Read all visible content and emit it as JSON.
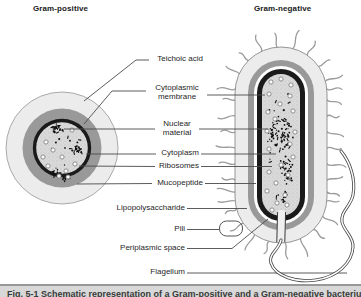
{
  "figure": {
    "titles": {
      "left": "Gram-positive",
      "right": "Gram-negative"
    },
    "labels": {
      "teichoic_acid": "Teichoic acid",
      "cytoplasmic_membrane": "Cytoplasmic membrane",
      "nuclear_material": "Nuclear material",
      "cytoplasm": "Cytoplasm",
      "ribosomes": "Ribosomes",
      "mucopeptide": "Mucopeptide",
      "lipopolysaccharide": "Lipopolysaccharide",
      "pili": "Pili",
      "periplasmic_space": "Periplasmic space",
      "flagellum": "Flagellum"
    },
    "caption": "Fig. 5-1 Schematic representation of a Gram-positive and a Gram-negative bacterium",
    "colors": {
      "background": "#ffffff",
      "outer_layer": "#ececec",
      "wall_dark": "#999999",
      "membrane_black": "#1a1a1a",
      "cytoplasm_stipple": "#d9d9d9",
      "leader_line": "#4a4a4a",
      "pili_hair": "#9b9b9b",
      "caption_bar": "#d8d8d8"
    }
  }
}
